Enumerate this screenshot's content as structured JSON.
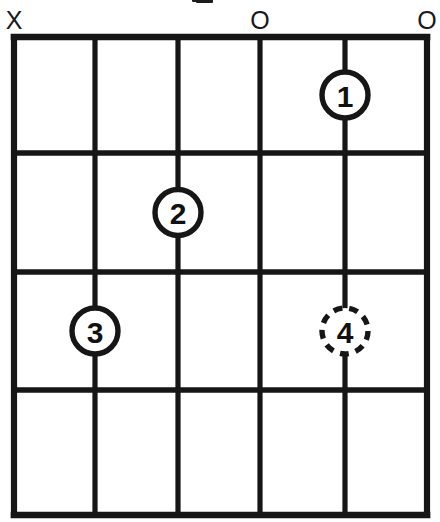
{
  "diagram": {
    "kind": "guitar-chord-diagram",
    "string_count": 6,
    "fret_count": 4,
    "starting_fret": 1,
    "ink_color": "#161616",
    "background_color": "#ffffff"
  },
  "title": {
    "visible_text": "",
    "note": "chord name cropped off above top edge; only bottom tips of glyphs visible"
  },
  "open_mute_markers": [
    {
      "string": 1,
      "symbol": "X",
      "meaning": "muted"
    },
    {
      "string": 2,
      "symbol": "",
      "meaning": "fretted"
    },
    {
      "string": 3,
      "symbol": "",
      "meaning": "fretted"
    },
    {
      "string": 4,
      "symbol": "O",
      "meaning": "open"
    },
    {
      "string": 5,
      "symbol": "",
      "meaning": "fretted"
    },
    {
      "string": 6,
      "symbol": "O",
      "meaning": "open"
    }
  ],
  "finger_positions": [
    {
      "finger": "1",
      "string": 5,
      "fret": 1,
      "style": "solid",
      "optional": false
    },
    {
      "finger": "2",
      "string": 3,
      "fret": 2,
      "style": "solid",
      "optional": false
    },
    {
      "finger": "3",
      "string": 2,
      "fret": 3,
      "style": "solid",
      "optional": false
    },
    {
      "finger": "4",
      "string": 5,
      "fret": 3,
      "style": "dashed",
      "optional": true
    }
  ],
  "geometry": {
    "string_x": [
      14,
      95,
      178,
      260,
      345,
      427
    ],
    "fret_y": [
      37,
      153,
      272,
      390,
      515
    ],
    "marker_y": 29,
    "circle_radius": 23
  }
}
